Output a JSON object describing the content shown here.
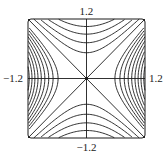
{
  "chart_data": {
    "type": "contour",
    "title": "",
    "function": "x^2 - y^2",
    "xlabel": "",
    "ylabel": "",
    "xlim": [
      -1.2,
      1.2
    ],
    "ylim": [
      -1.2,
      1.2
    ],
    "grid": false,
    "axes_through_origin": true,
    "critical_point": {
      "x": 0,
      "y": 0,
      "type": "saddle",
      "marker": "dot"
    },
    "tick_labels": {
      "top": "1.2",
      "bottom": "−1.2",
      "left": "−1.2",
      "right": "1.2"
    },
    "levels_positive": [
      0.34,
      0.47,
      0.6,
      0.73,
      0.86,
      0.99,
      1.12,
      1.25,
      1.38
    ],
    "levels_negative": [
      -0.27,
      -0.52,
      -0.8,
      -1.1
    ],
    "level_zero": 0,
    "line_color": "#1a1a1a",
    "frame_color": "#1a1a1a"
  },
  "plot_area": {
    "left": 28,
    "top": 19,
    "right": 145,
    "bottom": 138
  }
}
